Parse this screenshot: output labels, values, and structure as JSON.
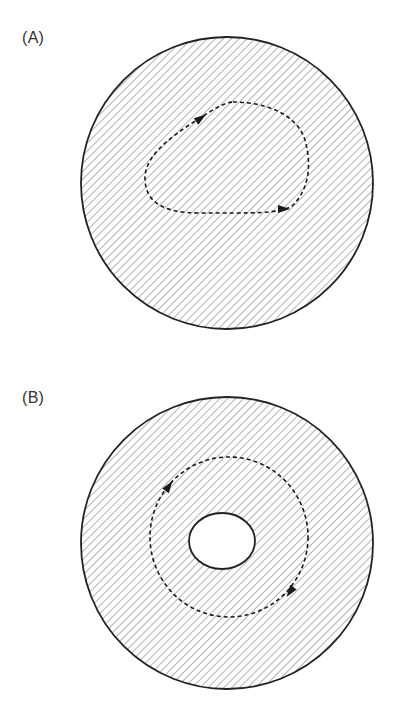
{
  "figure": {
    "panels": [
      {
        "id": "A",
        "label": "(A)",
        "description": "Simply connected region with closed loop",
        "outer_circle": {
          "cx": 227,
          "cy": 183,
          "r": 146
        },
        "hole": null,
        "loop_path": "M 233 102 C 262 102, 296 112, 305 140 C 312 165, 309 190, 292 206 C 280 214, 250 213, 200 213 C 160 213, 146 200, 145 180 C 144 158, 165 140, 200 118 C 213 110, 222 103, 233 102 Z",
        "arrows": [
          {
            "x": 201,
            "y": 118,
            "angle": -35
          },
          {
            "x": 284,
            "y": 209,
            "angle": 0
          }
        ]
      },
      {
        "id": "B",
        "label": "(B)",
        "description": "Multiply connected region (annulus) with closed loop around the hole",
        "outer_circle": {
          "cx": 227,
          "cy": 543,
          "r": 146
        },
        "hole": {
          "cx": 222,
          "cy": 541,
          "rx": 33,
          "ry": 28
        },
        "loop_ellipse": {
          "cx": 229,
          "cy": 537,
          "rx": 79,
          "ry": 80
        },
        "arrows": [
          {
            "x": 169,
            "y": 486,
            "angle": -55
          },
          {
            "x": 290,
            "y": 592,
            "angle": 125
          }
        ]
      }
    ],
    "style": {
      "outline_color": "#222222",
      "hatch_color": "#8a8a8a",
      "hatch_spacing": 4,
      "loop_color": "#1a1a1a",
      "background": "#ffffff"
    }
  }
}
